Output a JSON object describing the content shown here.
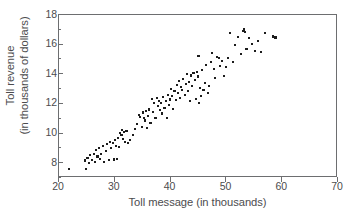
{
  "chart_data": {
    "type": "scatter",
    "title": "",
    "xlabel": "Toll message (in thousands)",
    "ylabel_line1": "Toll revenue",
    "ylabel_line2": "(in thousands of dollars)",
    "xlim": [
      20,
      70
    ],
    "ylim": [
      7.0,
      18.0
    ],
    "xticks": [
      20,
      30,
      40,
      50,
      60,
      70
    ],
    "xtick_labels": [
      "20",
      "30",
      "40",
      "50",
      "60",
      "70"
    ],
    "yticks": [
      8,
      10,
      12,
      14,
      16,
      18
    ],
    "ytick_labels": [
      "8",
      "10",
      "12",
      "14",
      "16",
      "18"
    ],
    "yticks_minor": [
      7,
      9,
      11,
      13,
      15,
      17
    ],
    "grid": false,
    "legend": null,
    "marker": "square",
    "marker_color": "#1c1c1c",
    "marker_size_px": 2.1,
    "frame_color": "#6d6e70",
    "n_points": 131,
    "points": [
      [
        21.8,
        7.58
      ],
      [
        24.6,
        8.18
      ],
      [
        24.9,
        7.62
      ],
      [
        25.1,
        8.32
      ],
      [
        25.4,
        8.02
      ],
      [
        25.6,
        8.55
      ],
      [
        25.9,
        8.22
      ],
      [
        26.2,
        8.6
      ],
      [
        26.4,
        8.05
      ],
      [
        26.7,
        8.88
      ],
      [
        26.9,
        8.45
      ],
      [
        27.2,
        9.05
      ],
      [
        27.4,
        8.3
      ],
      [
        27.6,
        8.62
      ],
      [
        27.9,
        9.18
      ],
      [
        28.1,
        8.08
      ],
      [
        28.4,
        8.85
      ],
      [
        28.6,
        9.3
      ],
      [
        28.9,
        8.22
      ],
      [
        29.1,
        9.42
      ],
      [
        29.3,
        9.02
      ],
      [
        29.6,
        9.35
      ],
      [
        29.8,
        8.25
      ],
      [
        30.0,
        9.55
      ],
      [
        30.2,
        9.15
      ],
      [
        30.4,
        8.28
      ],
      [
        30.6,
        9.72
      ],
      [
        30.8,
        9.08
      ],
      [
        31.0,
        10.05
      ],
      [
        31.2,
        9.88
      ],
      [
        31.3,
        10.22
      ],
      [
        31.5,
        9.62
      ],
      [
        31.7,
        10.12
      ],
      [
        31.9,
        9.45
      ],
      [
        32.1,
        10.18
      ],
      [
        32.4,
        9.35
      ],
      [
        32.8,
        9.58
      ],
      [
        33.2,
        9.92
      ],
      [
        33.6,
        10.3
      ],
      [
        34.0,
        10.62
      ],
      [
        34.3,
        11.28
      ],
      [
        34.5,
        11.12
      ],
      [
        34.8,
        10.45
      ],
      [
        35.0,
        11.42
      ],
      [
        35.2,
        11.05
      ],
      [
        35.4,
        10.88
      ],
      [
        35.6,
        11.55
      ],
      [
        35.8,
        10.35
      ],
      [
        36.0,
        11.18
      ],
      [
        36.2,
        11.62
      ],
      [
        36.4,
        10.72
      ],
      [
        36.6,
        12.32
      ],
      [
        36.9,
        11.48
      ],
      [
        37.1,
        12.08
      ],
      [
        37.3,
        11.02
      ],
      [
        37.5,
        12.42
      ],
      [
        37.7,
        11.85
      ],
      [
        37.9,
        12.22
      ],
      [
        38.1,
        11.6
      ],
      [
        38.3,
        12.05
      ],
      [
        38.5,
        11.35
      ],
      [
        38.7,
        12.48
      ],
      [
        38.9,
        11.72
      ],
      [
        39.1,
        12.18
      ],
      [
        39.3,
        11.05
      ],
      [
        39.5,
        12.62
      ],
      [
        39.7,
        11.92
      ],
      [
        39.9,
        12.3
      ],
      [
        40.1,
        13.02
      ],
      [
        40.3,
        12.55
      ],
      [
        40.5,
        11.68
      ],
      [
        40.7,
        12.88
      ],
      [
        40.9,
        12.25
      ],
      [
        41.1,
        13.28
      ],
      [
        41.3,
        12.72
      ],
      [
        41.5,
        13.55
      ],
      [
        41.7,
        12.42
      ],
      [
        41.9,
        13.12
      ],
      [
        42.1,
        12.95
      ],
      [
        42.3,
        13.7
      ],
      [
        42.5,
        12.58
      ],
      [
        42.7,
        13.35
      ],
      [
        42.9,
        14.02
      ],
      [
        43.1,
        12.85
      ],
      [
        43.3,
        13.48
      ],
      [
        43.5,
        12.18
      ],
      [
        43.7,
        13.92
      ],
      [
        43.9,
        13.22
      ],
      [
        44.1,
        14.08
      ],
      [
        44.3,
        13.62
      ],
      [
        44.5,
        12.32
      ],
      [
        44.7,
        14.18
      ],
      [
        44.9,
        13.85
      ],
      [
        45.0,
        15.25
      ],
      [
        45.1,
        12.08
      ],
      [
        45.3,
        13.05
      ],
      [
        45.5,
        12.55
      ],
      [
        45.6,
        14.28
      ],
      [
        45.9,
        12.92
      ],
      [
        46.2,
        13.42
      ],
      [
        46.4,
        14.62
      ],
      [
        46.7,
        12.72
      ],
      [
        46.9,
        13.18
      ],
      [
        47.2,
        14.85
      ],
      [
        47.5,
        15.42
      ],
      [
        47.8,
        14.35
      ],
      [
        48.0,
        13.75
      ],
      [
        48.3,
        15.18
      ],
      [
        48.6,
        15.08
      ],
      [
        48.9,
        14.55
      ],
      [
        49.2,
        14.92
      ],
      [
        49.5,
        13.88
      ],
      [
        49.9,
        14.48
      ],
      [
        50.3,
        15.12
      ],
      [
        50.7,
        16.78
      ],
      [
        51.2,
        14.82
      ],
      [
        51.6,
        15.95
      ],
      [
        52.1,
        16.52
      ],
      [
        52.6,
        15.38
      ],
      [
        52.9,
        16.92
      ],
      [
        53.1,
        17.02
      ],
      [
        53.3,
        16.88
      ],
      [
        53.6,
        15.72
      ],
      [
        54.1,
        16.42
      ],
      [
        54.6,
        16.05
      ],
      [
        55.1,
        15.55
      ],
      [
        55.6,
        16.22
      ],
      [
        56.2,
        15.52
      ],
      [
        56.9,
        16.78
      ],
      [
        58.4,
        16.55
      ],
      [
        58.8,
        16.48
      ]
    ]
  }
}
